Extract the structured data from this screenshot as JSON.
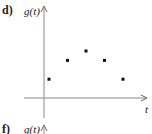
{
  "panels": [
    {
      "label": "d)",
      "ylabel": "g(t)",
      "xlabel": "t"
    },
    {
      "label": "f)",
      "ylabel": "g(t)"
    }
  ],
  "chart_data": {
    "type": "scatter",
    "title": "",
    "xlabel": "t",
    "ylabel": "g(t)",
    "x": [
      1,
      2,
      3,
      4,
      5
    ],
    "values": [
      1,
      2,
      2.5,
      2,
      1
    ],
    "grid": false,
    "legend": null,
    "note": "Unlabeled axes; relative heights estimated from pixel positions"
  }
}
